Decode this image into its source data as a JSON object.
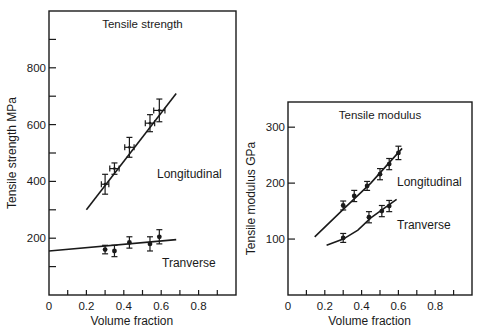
{
  "chart_data": [
    {
      "type": "line",
      "title": "Tensile strength",
      "xlabel": "Volume fraction",
      "ylabel": "Tensile strength MPa",
      "xlim": [
        0,
        1.0
      ],
      "ylim": [
        0,
        1000
      ],
      "xticks": [
        0,
        0.1,
        0.2,
        0.3,
        0.4,
        0.5,
        0.6,
        0.7,
        0.8,
        0.9
      ],
      "xtick_labels": [
        "0",
        "",
        "0.2",
        "",
        "0.4",
        "",
        "0.6",
        "",
        "0.8",
        ""
      ],
      "yticks": [
        100,
        200,
        300,
        400,
        500,
        600,
        700,
        800,
        900
      ],
      "ytick_labels": [
        "",
        "200",
        "",
        "400",
        "",
        "600",
        "",
        "800",
        ""
      ],
      "grid": false,
      "legend": "inline labels",
      "frame": {
        "x0": 49,
        "x1": 236,
        "y0": 11,
        "y1": 295
      },
      "series": [
        {
          "name": "Longitudinal",
          "label_pos": [
            157,
            178
          ],
          "points": [
            {
              "x": 0.3,
              "y": 390,
              "xerr": 0.02,
              "yerr": 35
            },
            {
              "x": 0.35,
              "y": 445,
              "xerr": 0.025,
              "yerr": 20
            },
            {
              "x": 0.43,
              "y": 520,
              "xerr": 0.025,
              "yerr": 35
            },
            {
              "x": 0.54,
              "y": 605,
              "xerr": 0.025,
              "yerr": 30
            },
            {
              "x": 0.59,
              "y": 650,
              "xerr": 0.03,
              "yerr": 40
            }
          ],
          "fit": [
            [
              0.2,
              300
            ],
            [
              0.68,
              710
            ]
          ],
          "marker": "cross"
        },
        {
          "name": "Tranverse",
          "label_pos": [
            162,
            267
          ],
          "points": [
            {
              "x": 0.3,
              "y": 160,
              "xerr": 0,
              "yerr": 15
            },
            {
              "x": 0.35,
              "y": 155,
              "xerr": 0,
              "yerr": 20
            },
            {
              "x": 0.43,
              "y": 185,
              "xerr": 0,
              "yerr": 20
            },
            {
              "x": 0.54,
              "y": 180,
              "xerr": 0,
              "yerr": 25
            },
            {
              "x": 0.59,
              "y": 205,
              "xerr": 0,
              "yerr": 25
            }
          ],
          "fit": [
            [
              0.0,
              155
            ],
            [
              0.68,
              195
            ]
          ],
          "marker": "dot"
        }
      ]
    },
    {
      "type": "line",
      "title": "Tensile modulus",
      "xlabel": "Volume fraction",
      "ylabel": "Tensile modulus GPa",
      "xlim": [
        0,
        1.0
      ],
      "ylim": [
        0,
        345
      ],
      "xticks": [
        0,
        0.1,
        0.2,
        0.3,
        0.4,
        0.5,
        0.6,
        0.7,
        0.8,
        0.9
      ],
      "xtick_labels": [
        "0",
        "",
        "0.2",
        "",
        "0.4",
        "",
        "0.6",
        "",
        "0.8",
        ""
      ],
      "yticks": [
        100,
        200,
        300
      ],
      "ytick_labels": [
        "100",
        "200",
        "300"
      ],
      "grid": false,
      "legend": "inline labels",
      "frame": {
        "x0": 288,
        "x1": 472,
        "y0": 102,
        "y1": 295
      },
      "series": [
        {
          "name": "Longitudinal",
          "label_pos": [
            397,
            186
          ],
          "points": [
            {
              "x": 0.3,
              "y": 160,
              "xerr": 0,
              "yerr": 8
            },
            {
              "x": 0.36,
              "y": 177,
              "xerr": 0,
              "yerr": 10
            },
            {
              "x": 0.43,
              "y": 195,
              "xerr": 0,
              "yerr": 8
            },
            {
              "x": 0.5,
              "y": 216,
              "xerr": 0,
              "yerr": 10
            },
            {
              "x": 0.55,
              "y": 234,
              "xerr": 0,
              "yerr": 10
            },
            {
              "x": 0.6,
              "y": 254,
              "xerr": 0,
              "yerr": 12
            }
          ],
          "fit": [
            [
              0.145,
              104
            ],
            [
              0.3,
              153
            ],
            [
              0.45,
              200
            ],
            [
              0.62,
              262
            ]
          ],
          "marker": "dot"
        },
        {
          "name": "Tranverse",
          "label_pos": [
            397,
            229
          ],
          "points": [
            {
              "x": 0.3,
              "y": 102,
              "xerr": 0,
              "yerr": 8
            },
            {
              "x": 0.44,
              "y": 139,
              "xerr": 0,
              "yerr": 10
            },
            {
              "x": 0.51,
              "y": 150,
              "xerr": 0,
              "yerr": 10
            },
            {
              "x": 0.55,
              "y": 159,
              "xerr": 0,
              "yerr": 10
            }
          ],
          "fit": [
            [
              0.21,
              89
            ],
            [
              0.3,
              100
            ],
            [
              0.38,
              116
            ],
            [
              0.45,
              138
            ],
            [
              0.59,
              171
            ]
          ],
          "marker": "dot"
        }
      ]
    }
  ]
}
